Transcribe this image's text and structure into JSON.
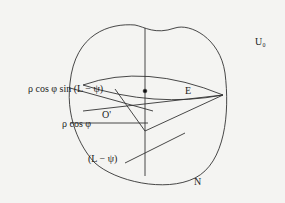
{
  "diagram": {
    "orientation_degrees": 180,
    "labels": {
      "top_pole": "U₀",
      "center_point": "E",
      "bottom_point": "N",
      "origin_point": "O'",
      "sine_term": "ρ cos φ sin (L − ψ)",
      "cos_term": "ρ cos φ",
      "angle": "(L − ψ)"
    }
  }
}
